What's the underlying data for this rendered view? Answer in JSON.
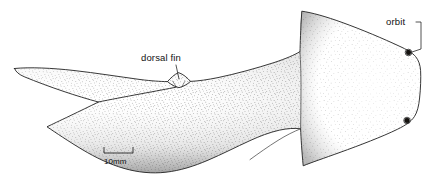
{
  "figure": {
    "kind": "scientific-line-illustration",
    "background_color": "#ffffff",
    "ink_color": "#232323",
    "stipple_color": "#4a4a4a",
    "width_px": 436,
    "height_px": 179
  },
  "annotations": {
    "orbit": {
      "label": "orbit",
      "text_x": 386,
      "text_y": 25,
      "leader_path": "M 416 22 L 421 22 L 421 49 L 412 52",
      "targets": [
        {
          "name": "orbit-upper",
          "cx": 408.5,
          "cy": 52.5,
          "r": 2.5
        },
        {
          "name": "orbit-lower",
          "cx": 407.0,
          "cy": 120.5,
          "r": 2.5
        }
      ]
    },
    "dorsal_fin": {
      "label": "dorsal fin",
      "text_x": 141,
      "text_y": 61,
      "leader_path": "M 176 65 L 179 79"
    }
  },
  "scale_bar": {
    "label": "10mm",
    "x_start": 104,
    "x_end": 133,
    "y_baseline": 153,
    "tick_height": 6,
    "text_x": 104,
    "text_y": 164
  },
  "shapes": {
    "body_outline": "M 14.5 68.5 C 30 67 52 68 74 70.5 C 96 73 118 76.5 140 79.5 C 152 81 160 81.5 167.5 81.6 C 170.5 78.2 174 74.6 178.5 72.6 C 183.5 74.2 187.5 78.0 190.5 81.4 C 199 81.0 208 79.6 218 77.6 C 236 73.8 256 68.4 274 62.6 C 286 58.6 294 55.2 300 51.6 C 300.2 44 300.6 30 301.8 11.2 C 312 12.6 326 16.6 342 22.4 C 362 29.6 384 39.0 399 46.0 C 407 49.6 412.4 52.8 415.6 56.6 C 418.6 60.2 420.2 64.8 420.6 70.6 C 421.0 78.0 420.6 88.6 419.6 98.0 C 418.8 106.0 417.2 112.4 414.4 116.6 C 411.2 121.4 405.8 125.2 397.6 129.2 C 382 136.8 360 145.2 340 152.4 C 324 158.2 311 162.6 303.2 165.8 C 301.8 151.0 301.0 138.4 300.6 128.8 C 294.8 128.0 287.2 128.4 279.2 130.2 C 269.6 132.4 259.6 136.2 250 140.6 C 236 147.0 222 154.2 208 160.2 C 194 166.2 180 170.6 166 172.2 C 152 173.8 138 172.4 124 168.4 C 110 164.4 96 157.8 82 149.4 C 68 141.0 56 132.8 47.0 126.8 C 52 124.4 60 120.6 70 115.8 C 80 111.0 90 106.2 98.4 102.0 C 88 99.2 76 95.6 63 91.2 C 50 86.8 36 81.6 24.4 76.8 C 19.2 74.6 16 72.2 14.5 68.5 Z",
    "head_junction": "M 300 51.6 C 300.6 62 301.0 74 301.0 86 C 301.0 100 300.8 115 300.6 128.8",
    "tail_notch": "M 98.4 102.0 C 110 99.6 124 97.0 140 94.0 C 156 91.0 168 88.8 176 87.2",
    "dorsal_fin_base": "M 167.5 81.6 C 171 84.6 175 86.8 179 87.6 C 183 86.8 187 84.6 190.5 81.4",
    "dorsal_fin_crease_left": "M 172.5 81.0 L 176.5 87.0",
    "dorsal_fin_crease_right": "M 185.0 81.2 L 181.5 87.2",
    "belly_fold": "M 300.6 128.8 C 294 131.4 286 135.4 278 140.4 C 268 146.6 258 153.8 250 159.6"
  }
}
